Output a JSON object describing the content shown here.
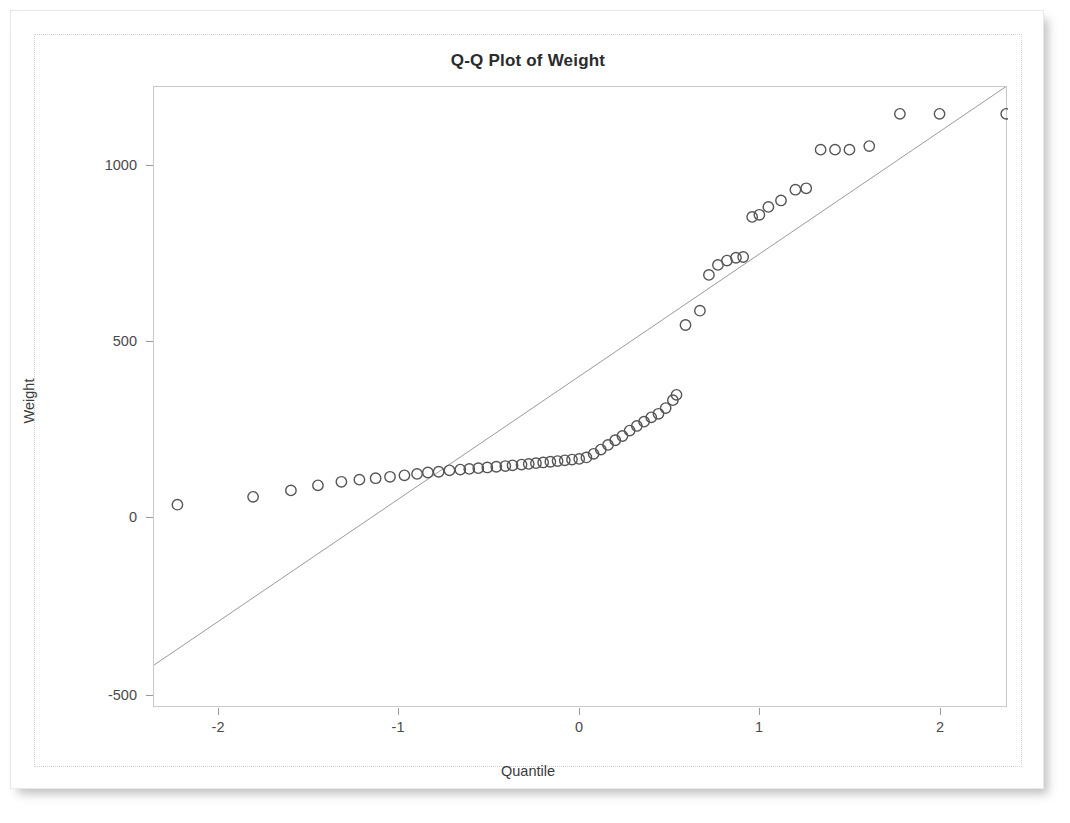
{
  "chart_data": {
    "type": "scatter",
    "title": "Q-Q Plot of Weight",
    "xlabel": "Quantile",
    "ylabel": "Weight",
    "xlim": [
      -2.45,
      2.29
    ],
    "ylim": [
      -560,
      1175
    ],
    "xticks": [
      -2,
      -1,
      0,
      1,
      2
    ],
    "xticklabels": [
      "-2",
      "-1",
      "0",
      "1",
      "2"
    ],
    "yticks": [
      1000,
      500,
      0,
      -500
    ],
    "yticklabels": [
      "1000",
      "500",
      "0",
      "-500"
    ],
    "grid": false,
    "legend": null,
    "marker": "open-circle",
    "marker_color": "#555555",
    "reference_line": {
      "label": "normal reference line",
      "color": "#9a9a9a",
      "x": [
        -2.45,
        2.29
      ],
      "y": [
        -440,
        1180
      ]
    },
    "x": [
      -2.32,
      -1.9,
      -1.69,
      -1.54,
      -1.41,
      -1.31,
      -1.22,
      -1.14,
      -1.06,
      -0.99,
      -0.93,
      -0.87,
      -0.81,
      -0.75,
      -0.7,
      -0.65,
      -0.6,
      -0.55,
      -0.5,
      -0.46,
      -0.41,
      -0.37,
      -0.33,
      -0.29,
      -0.25,
      -0.21,
      -0.17,
      -0.13,
      -0.09,
      -0.05,
      -0.01,
      0.03,
      0.07,
      0.11,
      0.15,
      0.19,
      0.23,
      0.27,
      0.31,
      0.35,
      0.39,
      0.43,
      0.45,
      0.5,
      0.58,
      0.63,
      0.68,
      0.73,
      0.78,
      0.82,
      0.87,
      0.91,
      0.96,
      1.03,
      1.11,
      1.17,
      1.25,
      1.33,
      1.41,
      1.52,
      1.69,
      1.91,
      2.28
    ],
    "y": [
      8,
      30,
      48,
      62,
      72,
      78,
      82,
      86,
      90,
      94,
      98,
      100,
      104,
      106,
      108,
      110,
      112,
      114,
      116,
      118,
      120,
      122,
      124,
      126,
      128,
      130,
      132,
      134,
      136,
      140,
      150,
      162,
      175,
      188,
      200,
      215,
      228,
      240,
      252,
      262,
      278,
      300,
      315,
      510,
      550,
      650,
      678,
      690,
      698,
      700,
      812,
      818,
      840,
      858,
      888,
      892,
      1000,
      1000,
      1000,
      1010,
      1100,
      1100,
      1100
    ]
  },
  "chart": {
    "title": "Q-Q Plot of Weight",
    "x_axis_title": "Quantile",
    "y_axis_title": "Weight",
    "x_tick_labels": [
      "-2",
      "-1",
      "0",
      "1",
      "2"
    ],
    "y_tick_labels": [
      "1000",
      "500",
      "0",
      "-500"
    ]
  }
}
